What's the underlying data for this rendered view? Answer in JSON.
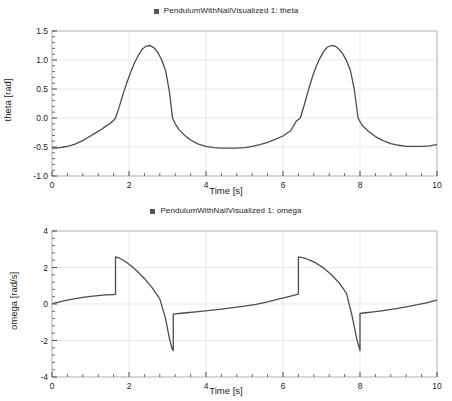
{
  "chart_data": [
    {
      "type": "line",
      "title": "",
      "legend": {
        "entries": [
          "PendulumWithNailVisualized 1: theta"
        ],
        "position": "top-center",
        "marker": "square",
        "marker_color": "#555555"
      },
      "xlabel": "Time [s]",
      "ylabel": "theta [rad]",
      "xlim": [
        0,
        10
      ],
      "ylim": [
        -1.0,
        1.5
      ],
      "xticks": [
        0,
        2,
        4,
        6,
        8,
        10
      ],
      "xtick_labels": [
        "0",
        "2",
        "4",
        "6",
        "8",
        "10"
      ],
      "yticks": [
        -1.0,
        -0.5,
        0.0,
        0.5,
        1.0,
        1.5
      ],
      "ytick_labels": [
        "-1.0",
        "-0.5",
        "0.0",
        "0.5",
        "1.0",
        "1.5"
      ],
      "grid": true,
      "line_color": "#4d4d4d",
      "series": [
        {
          "name": "PendulumWithNailVisualized 1: theta",
          "x": [
            0.0,
            0.1,
            0.2,
            0.3,
            0.4,
            0.5,
            0.6,
            0.7,
            0.8,
            0.9,
            1.0,
            1.1,
            1.2,
            1.3,
            1.4,
            1.5,
            1.6,
            1.65,
            1.75,
            1.85,
            1.95,
            2.05,
            2.15,
            2.25,
            2.35,
            2.45,
            2.55,
            2.65,
            2.75,
            2.85,
            2.95,
            3.05,
            3.13,
            3.2,
            3.3,
            3.4,
            3.5,
            3.6,
            3.8,
            4.0,
            4.2,
            4.4,
            4.6,
            4.8,
            5.0,
            5.2,
            5.4,
            5.6,
            5.8,
            6.0,
            6.2,
            6.35,
            6.45,
            6.55,
            6.65,
            6.75,
            6.85,
            6.95,
            7.05,
            7.15,
            7.25,
            7.35,
            7.45,
            7.55,
            7.65,
            7.75,
            7.85,
            7.95,
            8.05,
            8.2,
            8.4,
            8.6,
            8.8,
            9.0,
            9.2,
            9.4,
            9.6,
            9.8,
            10.0
          ],
          "y": [
            -0.52,
            -0.52,
            -0.51,
            -0.5,
            -0.49,
            -0.47,
            -0.45,
            -0.42,
            -0.39,
            -0.35,
            -0.31,
            -0.27,
            -0.23,
            -0.19,
            -0.14,
            -0.1,
            -0.04,
            0.0,
            0.2,
            0.42,
            0.62,
            0.8,
            0.96,
            1.09,
            1.19,
            1.24,
            1.25,
            1.21,
            1.13,
            1.0,
            0.82,
            0.45,
            0.0,
            -0.1,
            -0.2,
            -0.27,
            -0.33,
            -0.38,
            -0.45,
            -0.49,
            -0.51,
            -0.52,
            -0.52,
            -0.52,
            -0.51,
            -0.49,
            -0.46,
            -0.42,
            -0.37,
            -0.31,
            -0.22,
            -0.05,
            0.0,
            0.22,
            0.46,
            0.68,
            0.87,
            1.02,
            1.14,
            1.22,
            1.25,
            1.24,
            1.19,
            1.11,
            0.99,
            0.82,
            0.5,
            0.0,
            -0.12,
            -0.22,
            -0.32,
            -0.39,
            -0.44,
            -0.47,
            -0.49,
            -0.49,
            -0.49,
            -0.48,
            -0.46
          ]
        }
      ]
    },
    {
      "type": "line",
      "title": "",
      "legend": {
        "entries": [
          "PendulumWithNailVisualized 1: omega"
        ],
        "position": "top-center",
        "marker": "square",
        "marker_color": "#555555"
      },
      "xlabel": "Time [s]",
      "ylabel": "omega [rad/s]",
      "xlim": [
        0,
        10
      ],
      "ylim": [
        -4,
        4
      ],
      "xticks": [
        0,
        2,
        4,
        6,
        8,
        10
      ],
      "xtick_labels": [
        "0",
        "2",
        "4",
        "6",
        "8",
        "10"
      ],
      "yticks": [
        -4,
        -2,
        0,
        2,
        4
      ],
      "ytick_labels": [
        "-4",
        "-2",
        "0",
        "2",
        "4"
      ],
      "grid": true,
      "line_color": "#4d4d4d",
      "discontinuities": [
        1.65,
        3.15,
        6.4,
        8.0
      ],
      "series": [
        {
          "name": "PendulumWithNailVisualized 1: omega",
          "x": [
            0.0,
            0.2,
            0.4,
            0.6,
            0.8,
            1.0,
            1.2,
            1.4,
            1.6,
            1.65,
            1.65,
            1.75,
            1.85,
            1.95,
            2.05,
            2.2,
            2.4,
            2.6,
            2.8,
            2.95,
            3.05,
            3.12,
            3.15,
            3.15,
            3.3,
            3.5,
            3.8,
            4.1,
            4.4,
            4.7,
            5.0,
            5.3,
            5.6,
            5.9,
            6.1,
            6.3,
            6.4,
            6.4,
            6.5,
            6.6,
            6.7,
            6.85,
            7.05,
            7.25,
            7.45,
            7.65,
            7.8,
            7.92,
            8.0,
            8.0,
            8.15,
            8.35,
            8.6,
            8.9,
            9.2,
            9.5,
            9.75,
            10.0
          ],
          "y": [
            0.02,
            0.12,
            0.21,
            0.29,
            0.36,
            0.42,
            0.46,
            0.5,
            0.52,
            0.53,
            2.58,
            2.52,
            2.4,
            2.26,
            2.1,
            1.82,
            1.4,
            0.9,
            0.28,
            -0.8,
            -1.9,
            -2.45,
            -2.55,
            -0.55,
            -0.52,
            -0.48,
            -0.42,
            -0.35,
            -0.28,
            -0.2,
            -0.12,
            -0.02,
            0.12,
            0.28,
            0.38,
            0.48,
            0.54,
            2.58,
            2.54,
            2.48,
            2.4,
            2.25,
            1.98,
            1.62,
            1.18,
            0.58,
            -0.7,
            -1.95,
            -2.55,
            -0.52,
            -0.48,
            -0.43,
            -0.36,
            -0.27,
            -0.16,
            -0.04,
            0.08,
            0.21
          ]
        }
      ]
    }
  ]
}
